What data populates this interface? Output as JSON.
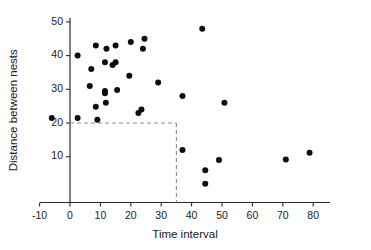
{
  "chart_data": {
    "type": "scatter",
    "title": "",
    "xlabel": "Time interval",
    "ylabel": "Distance between nests",
    "xlim": [
      -12,
      88
    ],
    "ylim": [
      0,
      54
    ],
    "xticks": [
      -10,
      0,
      10,
      20,
      30,
      40,
      50,
      60,
      70,
      80
    ],
    "yticks": [
      10,
      20,
      30,
      40,
      50
    ],
    "xticklabels": [
      "-10",
      "0",
      "10",
      "20",
      "30",
      "40",
      "50",
      "60",
      "70",
      "80"
    ],
    "yticklabels": [
      "10",
      "20",
      "30",
      "40",
      "50"
    ],
    "grid": false,
    "legend": null,
    "marker": "filled-circle",
    "marker_color": "#0d0d0d",
    "marker_size": 3,
    "points": [
      {
        "x": -6.0,
        "y": 21.5
      },
      {
        "x": 2.5,
        "y": 40.0
      },
      {
        "x": 2.5,
        "y": 21.5
      },
      {
        "x": 7.0,
        "y": 36.0
      },
      {
        "x": 6.5,
        "y": 31.0
      },
      {
        "x": 8.5,
        "y": 43.0
      },
      {
        "x": 8.5,
        "y": 24.8
      },
      {
        "x": 9.0,
        "y": 21.0
      },
      {
        "x": 11.5,
        "y": 38.0
      },
      {
        "x": 11.5,
        "y": 29.5
      },
      {
        "x": 11.5,
        "y": 28.8
      },
      {
        "x": 12.0,
        "y": 42.0
      },
      {
        "x": 11.8,
        "y": 26.0
      },
      {
        "x": 14.0,
        "y": 37.2
      },
      {
        "x": 15.0,
        "y": 43.0
      },
      {
        "x": 15.0,
        "y": 38.0
      },
      {
        "x": 15.5,
        "y": 29.8
      },
      {
        "x": 19.5,
        "y": 34.0
      },
      {
        "x": 20.0,
        "y": 44.0
      },
      {
        "x": 22.5,
        "y": 23.0
      },
      {
        "x": 23.5,
        "y": 24.0
      },
      {
        "x": 24.0,
        "y": 42.0
      },
      {
        "x": 24.5,
        "y": 45.0
      },
      {
        "x": 29.0,
        "y": 32.0
      },
      {
        "x": 37.0,
        "y": 28.0
      },
      {
        "x": 37.0,
        "y": 12.0
      },
      {
        "x": 43.5,
        "y": 48.0
      },
      {
        "x": 44.5,
        "y": 6.0
      },
      {
        "x": 44.5,
        "y": 2.0
      },
      {
        "x": 49.0,
        "y": 9.0
      },
      {
        "x": 50.8,
        "y": 26.0
      },
      {
        "x": 71.0,
        "y": 9.2
      },
      {
        "x": 78.8,
        "y": 11.2
      }
    ],
    "threshold": {
      "x_value": 35,
      "y_value": 20,
      "style": "dashed",
      "color": "#8c8c8c",
      "description": "dashed partition lines at y = 20 and x = 35"
    }
  }
}
